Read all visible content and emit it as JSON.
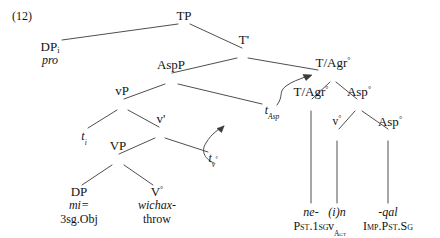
{
  "figure": {
    "example_number": "(12)",
    "type": "syntactic-tree-diagram"
  },
  "nodes": {
    "tp": "TP",
    "tbar": "T'",
    "dp_subject": "DP",
    "dp_subject_index": "i",
    "dp_subject_gloss": "pro",
    "aspp": "AspP",
    "vp_small": "vP",
    "vbar": "v'",
    "vp_big": "VP",
    "dp_object": "DP",
    "v_head": "V",
    "tagr_top": "T/Agr",
    "tagr_inner": "T/Agr",
    "asp_outer": "Asp",
    "v_little": "v",
    "asp_inner": "Asp",
    "degree": "°",
    "prime": "'"
  },
  "traces": {
    "t_subject": {
      "base": "t",
      "sub": "i"
    },
    "t_asp": {
      "base": "t",
      "sub": "Asp"
    },
    "t_v": {
      "base": "t",
      "sub": "v",
      "sub_sup": "°"
    }
  },
  "leaves": {
    "object": {
      "form": "mi=",
      "gloss": "3sg.Obj"
    },
    "verb": {
      "form": "wichax-",
      "gloss": "throw"
    },
    "tense": {
      "form": "ne-",
      "gloss": "Pst.1sg"
    },
    "little_v": {
      "form": "(i)n",
      "gloss": "v",
      "gloss_sub": "Agt"
    },
    "aspect": {
      "form": "-qal",
      "gloss": "Imp.Pst.Sg"
    }
  },
  "colors": {
    "ink": "#131313",
    "line": "#3a3a3a",
    "background": "#ffffff"
  }
}
